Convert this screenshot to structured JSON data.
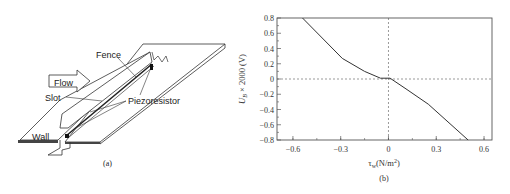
{
  "figure_a": {
    "labels": {
      "fence": "Fence",
      "flow": "Flow",
      "slot": "Slot",
      "piezoresistor": "Piezoresistor",
      "wall": "Wall"
    },
    "caption": "(a)"
  },
  "figure_b": {
    "caption": "(b)"
  },
  "chart_data": {
    "type": "line",
    "title": "",
    "xlabel": "τw(N/m²)",
    "ylabel": "U_B × 2000 (V)",
    "xlim": [
      -0.7,
      0.65
    ],
    "ylim": [
      -0.8,
      0.8
    ],
    "xticks": [
      "-0.6",
      "-0.3",
      "0",
      "0.3",
      "0.6"
    ],
    "yticks": [
      "0.8",
      "0.6",
      "0.4",
      "0.2",
      "0",
      "-0.2",
      "-0.4",
      "-0.6",
      "-0.8"
    ],
    "grid": false,
    "reference_lines": {
      "x": 0,
      "y": 0,
      "style": "dashed"
    },
    "series": [
      {
        "name": "U_B vs τw",
        "x": [
          -0.54,
          -0.29,
          -0.15,
          -0.05,
          0.01,
          0.11,
          0.25,
          0.5
        ],
        "y": [
          0.8,
          0.27,
          0.1,
          0.01,
          0.01,
          -0.13,
          -0.33,
          -0.8
        ]
      }
    ]
  }
}
